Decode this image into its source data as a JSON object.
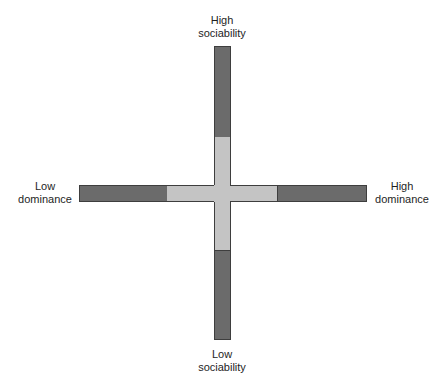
{
  "diagram": {
    "title": "",
    "axes": {
      "vertical": {
        "top_label_line1": "High",
        "top_label_line2": "sociability",
        "bottom_label_line1": "Low",
        "bottom_label_line2": "sociability"
      },
      "horizontal": {
        "left_label_line1": "Low",
        "left_label_line2": "dominance",
        "right_label_line1": "High",
        "right_label_line2": "dominance"
      }
    },
    "colors": {
      "extreme": "#6b6b6b",
      "center": "#c4c4c4",
      "outline": "#3e3e3e"
    }
  }
}
